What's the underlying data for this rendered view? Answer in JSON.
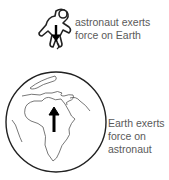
{
  "diagram": {
    "astronaut_label": {
      "line1": "astronaut exerts",
      "line2": "force on Earth"
    },
    "earth_label": {
      "line1": "Earth exerts",
      "line2": "force on",
      "line3": "astronaut"
    },
    "icons": [
      "astronaut-icon",
      "earth-globe-icon",
      "force-arrow-down-icon",
      "force-arrow-up-icon"
    ]
  }
}
